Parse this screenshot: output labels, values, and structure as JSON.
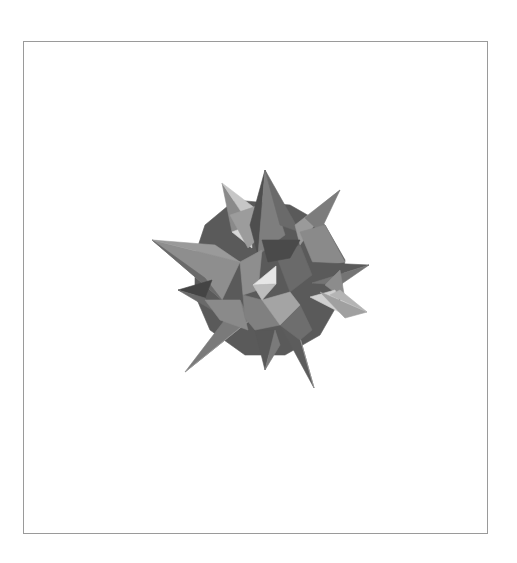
{
  "figure": {
    "frame": {
      "x": 23,
      "y": 41,
      "width": 466,
      "height": 494,
      "stroke": "#9a9a9a"
    },
    "colors": {
      "background": "#ffffff",
      "darkest": "#4a4a4a",
      "dark": "#5e5e5e",
      "mid_dark": "#6e6e6e",
      "mid": "#808080",
      "mid_light": "#939393",
      "light": "#a8a8a8",
      "lighter": "#c4c4c4",
      "highlight": "#e4e4e4"
    },
    "faces": [
      {
        "fill": "#5a5a5a",
        "points": "205,225 235,200 290,205 325,225 345,260 340,300 320,335 285,355 245,355 210,330 195,295 195,255"
      },
      {
        "fill": "#8e8e8e",
        "points": "152,240 240,262 222,300"
      },
      {
        "fill": "#6a6a6a",
        "points": "152,240 222,300 205,278"
      },
      {
        "fill": "#9a9a9a",
        "points": "152,240 215,245 240,262"
      },
      {
        "fill": "#8a8a8a",
        "points": "222,183 250,225 232,232"
      },
      {
        "fill": "#c6c6c6",
        "points": "222,183 250,225 260,212"
      },
      {
        "fill": "#d8d8d8",
        "points": "232,232 250,225 252,248"
      },
      {
        "fill": "#9c9c9c",
        "points": "230,215 260,205 262,235 248,248"
      },
      {
        "fill": "#4e4e4e",
        "points": "265,170 258,255 250,225"
      },
      {
        "fill": "#7e7e7e",
        "points": "265,170 285,235 258,255"
      },
      {
        "fill": "#6a6a6a",
        "points": "265,170 280,225 300,232"
      },
      {
        "fill": "#9a9a9a",
        "points": "340,190 295,225 300,245"
      },
      {
        "fill": "#7c7c7c",
        "points": "340,190 305,218 320,232"
      },
      {
        "fill": "#8a8a8a",
        "points": "300,232 325,225 345,262 315,268"
      },
      {
        "fill": "#5a5a5a",
        "points": "369,265 305,262 312,283"
      },
      {
        "fill": "#747474",
        "points": "369,265 312,283 340,285"
      },
      {
        "fill": "#8c8c8c",
        "points": "325,285 340,270 345,300"
      },
      {
        "fill": "#d0d0d0",
        "points": "310,297 335,290 345,315"
      },
      {
        "fill": "#a0a0a0",
        "points": "367,312 320,292 345,318"
      },
      {
        "fill": "#b4b4b4",
        "points": "367,312 340,290 330,295"
      },
      {
        "fill": "#444444",
        "points": "178,290 212,280 205,298"
      },
      {
        "fill": "#6a6a6a",
        "points": "178,290 205,298 212,310"
      },
      {
        "fill": "#7a7a7a",
        "points": "185,372 240,300 250,320"
      },
      {
        "fill": "#999999",
        "points": "185,372 250,320 225,340"
      },
      {
        "fill": "#8a8a8a",
        "points": "205,300 240,300 248,330 220,320"
      },
      {
        "fill": "#585858",
        "points": "265,370 255,330 275,330"
      },
      {
        "fill": "#7a7a7a",
        "points": "265,370 275,330 280,345"
      },
      {
        "fill": "#5c5c5c",
        "points": "314,388 280,325 295,320"
      },
      {
        "fill": "#9a9a9a",
        "points": "314,388 295,320 302,345"
      },
      {
        "fill": "#6e6e6e",
        "points": "280,325 300,305 312,330 300,340"
      },
      {
        "fill": "#8e8e8e",
        "points": "240,262 262,250 258,290 243,295"
      },
      {
        "fill": "#6a6a6a",
        "points": "276,255 300,245 312,275 290,292"
      },
      {
        "fill": "#4a4a4a",
        "points": "262,240 300,240 290,258 268,262"
      },
      {
        "fill": "#808080",
        "points": "243,295 262,300 280,325 255,330 245,318"
      },
      {
        "fill": "#a4a4a4",
        "points": "262,300 290,292 300,305 280,325"
      },
      {
        "fill": "#e6e6e6",
        "points": "253,285 276,266 276,284"
      },
      {
        "fill": "#bdbdbd",
        "points": "253,285 276,284 262,300"
      }
    ]
  }
}
